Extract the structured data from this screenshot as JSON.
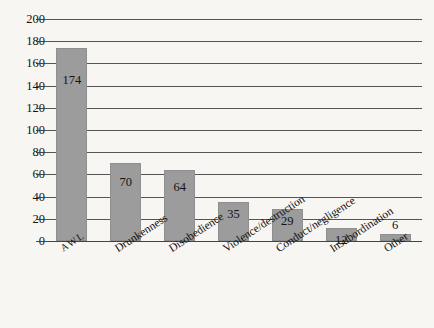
{
  "chart_data": {
    "type": "bar",
    "title": "",
    "subtitle": "",
    "xlabel": "",
    "ylabel": "",
    "ylim": [
      0,
      200
    ],
    "ytick_step": 20,
    "yticks": [
      200,
      180,
      160,
      140,
      120,
      100,
      80,
      60,
      40,
      20,
      0
    ],
    "ytick_labels": [
      "200",
      "180",
      "160",
      "140",
      "120",
      "100",
      "80",
      "60",
      "40",
      "20",
      "0"
    ],
    "grid": "horizontal",
    "legend": "none",
    "categories": [
      "AWL",
      "Drunkenness",
      "Disobedience",
      "Violence/destruction",
      "Conduct/negligence",
      "Insubordination",
      "Other"
    ],
    "values": [
      174,
      70,
      64,
      35,
      29,
      12,
      6
    ],
    "value_labels": [
      "174",
      "70",
      "64",
      "35",
      "29",
      "12",
      "6"
    ],
    "label_placement": [
      "inside",
      "inside",
      "inside",
      "inside",
      "inside",
      "inside",
      "above"
    ],
    "bar_color": "#9c9c9c",
    "background_color": "#f8f6f3",
    "gridline_color": "#555555",
    "text_color": "#15120f"
  }
}
